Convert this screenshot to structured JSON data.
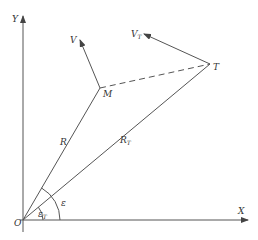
{
  "diagram": {
    "type": "geometry-vector-diagram",
    "stroke_color": "#555555",
    "text_color": "#333333",
    "axes": {
      "x_label": "X",
      "y_label": "Y",
      "origin_label": "O"
    },
    "points": {
      "missile": "M",
      "target": "T"
    },
    "vectors": {
      "missile_velocity": {
        "label": "V",
        "subscript": ""
      },
      "target_velocity": {
        "label": "V",
        "subscript": "T"
      }
    },
    "segments": {
      "missile_range": {
        "label": "R",
        "subscript": ""
      },
      "target_range": {
        "label": "R",
        "subscript": "T"
      },
      "line_of_sight": {
        "label": "",
        "style": "dashed"
      }
    },
    "angles": {
      "missile_angle": {
        "label": "ε",
        "subscript": ""
      },
      "target_angle": {
        "label": "ε",
        "subscript": "T"
      }
    }
  }
}
